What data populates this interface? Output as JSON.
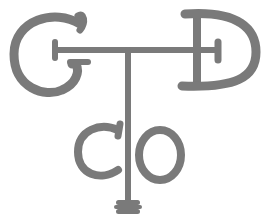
{
  "logo": {
    "description": "GTD Co monogram",
    "letters": [
      "G",
      "T",
      "D",
      "C",
      "O"
    ],
    "color": "#7a7a7a",
    "background": "#ffffff"
  }
}
